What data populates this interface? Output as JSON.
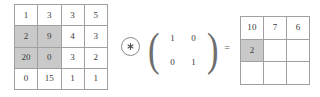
{
  "diagram": {
    "colors": {
      "highlight": "#c9c9c9",
      "grid_line": "#a0a0a0",
      "text": "#3a3a3a",
      "background": "#ffffff"
    }
  },
  "input_matrix": {
    "label": "input-feature-map",
    "rows": 4,
    "cols": 4,
    "values": [
      [
        "1",
        "3",
        "3",
        "5"
      ],
      [
        "2",
        "9",
        "4",
        "3"
      ],
      [
        "20",
        "0",
        "3",
        "2"
      ],
      [
        "0",
        "15",
        "1",
        "1"
      ]
    ],
    "highlighted_cells": [
      [
        1,
        0
      ],
      [
        1,
        1
      ],
      [
        2,
        0
      ],
      [
        2,
        1
      ]
    ]
  },
  "operator": {
    "name": "convolution-operator",
    "symbol": "⊛",
    "icon": "circled-asterisk-icon"
  },
  "kernel": {
    "label": "convolution-kernel",
    "rows": 2,
    "cols": 2,
    "left_bracket": "(",
    "right_bracket": ")",
    "values": [
      [
        "1",
        "0"
      ],
      [
        "0",
        "1"
      ]
    ]
  },
  "equals": {
    "symbol": "="
  },
  "output_matrix": {
    "label": "output-feature-map",
    "rows": 3,
    "cols": 3,
    "values": [
      [
        "10",
        "7",
        "6"
      ],
      [
        "2",
        "",
        ""
      ],
      [
        "",
        "",
        ""
      ]
    ],
    "highlighted_cells": [
      [
        1,
        0
      ]
    ]
  }
}
